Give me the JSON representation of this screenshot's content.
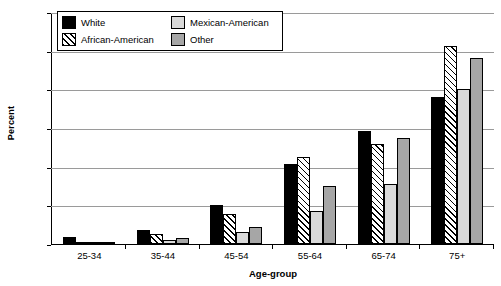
{
  "chart_data": {
    "type": "bar",
    "title": "",
    "xlabel": "Age-group",
    "ylabel": "Percent",
    "ylim": [
      0,
      60
    ],
    "ytick_step": 10,
    "yticks": [
      0,
      10,
      20,
      30,
      40,
      50,
      60
    ],
    "grid": true,
    "legend_position": "top-left-inside",
    "categories": [
      "25-34",
      "35-44",
      "45-54",
      "55-64",
      "65-74",
      "75+"
    ],
    "series": [
      {
        "name": "White",
        "color": "#000000",
        "pattern": "solid",
        "values": [
          1.7,
          3.4,
          10.0,
          20.5,
          29.0,
          38.0
        ]
      },
      {
        "name": "African-American",
        "color": "#ffffff",
        "pattern": "hatch",
        "values": [
          0.3,
          2.5,
          7.7,
          22.3,
          25.7,
          51.0
        ]
      },
      {
        "name": "Mexican-American",
        "color": "#d9d9d9",
        "pattern": "solid",
        "values": [
          0.4,
          0.8,
          3.0,
          8.5,
          15.3,
          40.0
        ]
      },
      {
        "name": "Other",
        "color": "#a6a6a6",
        "pattern": "solid",
        "values": [
          0.5,
          1.3,
          4.3,
          14.8,
          27.2,
          48.0
        ]
      }
    ]
  },
  "legend": {
    "items": [
      {
        "label": "White"
      },
      {
        "label": "African-American"
      },
      {
        "label": "Mexican-American"
      },
      {
        "label": "Other"
      }
    ]
  }
}
